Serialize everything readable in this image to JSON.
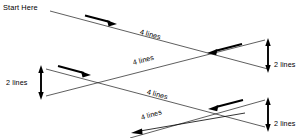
{
  "diagram": {
    "start_label": "Start Here",
    "stroke_color": "#1a1a1a",
    "background_color": "#ffffff",
    "segment_labels": {
      "pass_1": "4 lines",
      "pass_2": "4 lines",
      "pass_3": "4 lines",
      "pass_4": "4 lines"
    },
    "turn_labels": {
      "left_middle": "2 lines",
      "right_upper": "2 lines",
      "right_lower": "2 lines"
    },
    "arrow_directions": {
      "pass_1": "right-down",
      "pass_2": "right-down",
      "pass_3": "left-up",
      "pass_4": "left-down"
    }
  }
}
